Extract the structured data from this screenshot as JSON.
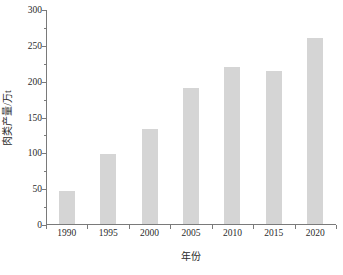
{
  "chart_data": {
    "type": "bar",
    "title": "",
    "subtitle": "",
    "xlabel": "年份",
    "ylabel": "肉类产量/万t",
    "categories": [
      "1990",
      "1995",
      "2000",
      "2005",
      "2010",
      "2015",
      "2020"
    ],
    "values": [
      46,
      97,
      133,
      190,
      219,
      213,
      259
    ],
    "series": [
      {
        "name": "肉类产量",
        "values": [
          46,
          97,
          133,
          190,
          219,
          213,
          259
        ]
      }
    ],
    "ylim": [
      0,
      300
    ],
    "y_major_ticks": [
      0,
      50,
      100,
      150,
      200,
      250,
      300
    ],
    "y_tick_labels": [
      "0",
      "50",
      "100",
      "150",
      "200",
      "250",
      "300"
    ],
    "y_minor_ticks": [
      25,
      75,
      125,
      175,
      225,
      275
    ],
    "grid": false,
    "legend": false,
    "legend_position": "none",
    "bar_color": "#d5d5d5",
    "axis_color": "#7a7a7a",
    "text_color": "#2b2b2b",
    "background_color": "#ffffff"
  }
}
